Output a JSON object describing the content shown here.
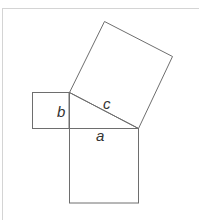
{
  "diagram": {
    "labels": {
      "a": "a",
      "b": "b",
      "c": "c"
    },
    "colors": {
      "stroke": "#6e6e6e",
      "label": "#333333",
      "frame": "#d4d4d4"
    }
  }
}
